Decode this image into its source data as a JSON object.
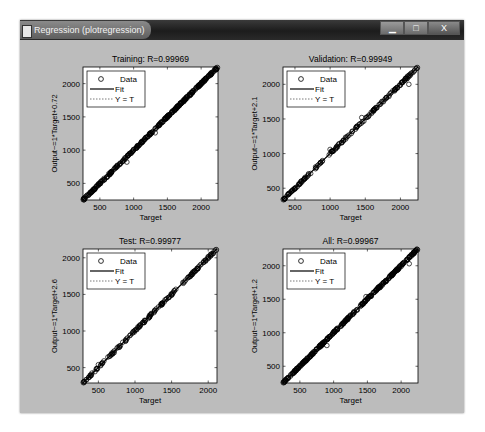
{
  "window": {
    "title": "Regression (plotregression)",
    "icon": "matlab-figure-icon",
    "buttons": [
      {
        "name": "minimize",
        "glyph": "▁"
      },
      {
        "name": "maximize",
        "glyph": "□"
      },
      {
        "name": "close",
        "glyph": "X"
      }
    ]
  },
  "colors": {
    "figure_bg": "#bcbcbc",
    "axes_bg": "#ffffff",
    "data": "#000000",
    "fit": "#000000",
    "identity": "#7a7a7a"
  },
  "chart_data": [
    {
      "type": "scatter",
      "title": "Training: R=0.99969",
      "xlabel": "Target",
      "ylabel": "Output~=1*Target+0.72",
      "xlim": [
        250,
        2250
      ],
      "ylim": [
        250,
        2250
      ],
      "xticks": [
        500,
        1000,
        1500,
        2000
      ],
      "yticks": [
        500,
        1000,
        1500,
        2000
      ],
      "legend": [
        "Data",
        "Fit",
        "Y = T"
      ],
      "legend_position": "northwest",
      "fit": {
        "slope": 1,
        "intercept": 0.72
      },
      "R": 0.99969,
      "points_desc": "dense points tightly along y=x from ~260 to ~2230"
    },
    {
      "type": "scatter",
      "title": "Validation: R=0.99949",
      "xlabel": "Target",
      "ylabel": "Output~=1*Target+2.1",
      "xlim": [
        330,
        2250
      ],
      "ylim": [
        330,
        2250
      ],
      "xticks": [
        500,
        1000,
        1500,
        2000
      ],
      "yticks": [
        500,
        1000,
        1500,
        2000
      ],
      "legend": [
        "Data",
        "Fit",
        "Y = T"
      ],
      "legend_position": "northwest",
      "fit": {
        "slope": 1,
        "intercept": 2.1
      },
      "R": 0.99949,
      "points_desc": "points along y=x from ~340 to ~2230 with small outliers near 1000 and 1450"
    },
    {
      "type": "scatter",
      "title": "Test: R=0.99977",
      "xlabel": "Target",
      "ylabel": "Output~=1*Target+2.6",
      "xlim": [
        290,
        2120
      ],
      "ylim": [
        290,
        2120
      ],
      "xticks": [
        500,
        1000,
        1500,
        2000
      ],
      "yticks": [
        500,
        1000,
        1500,
        2000
      ],
      "legend": [
        "Data",
        "Fit",
        "Y = T"
      ],
      "legend_position": "northwest",
      "fit": {
        "slope": 1,
        "intercept": 2.6
      },
      "R": 0.99977,
      "points_desc": "points along y=x from ~300 to ~2100, sparse gap near 1550-1650"
    },
    {
      "type": "scatter",
      "title": "All: R=0.99967",
      "xlabel": "Target",
      "ylabel": "Output~=1*Target+1.2",
      "xlim": [
        250,
        2250
      ],
      "ylim": [
        250,
        2250
      ],
      "xticks": [
        500,
        1000,
        1500,
        2000
      ],
      "yticks": [
        500,
        1000,
        1500,
        2000
      ],
      "legend": [
        "Data",
        "Fit",
        "Y = T"
      ],
      "legend_position": "northwest",
      "fit": {
        "slope": 1,
        "intercept": 1.2
      },
      "R": 0.99967,
      "points_desc": "dense points tightly along y=x from ~260 to ~2230, few outliers near 900 and 2100"
    }
  ]
}
